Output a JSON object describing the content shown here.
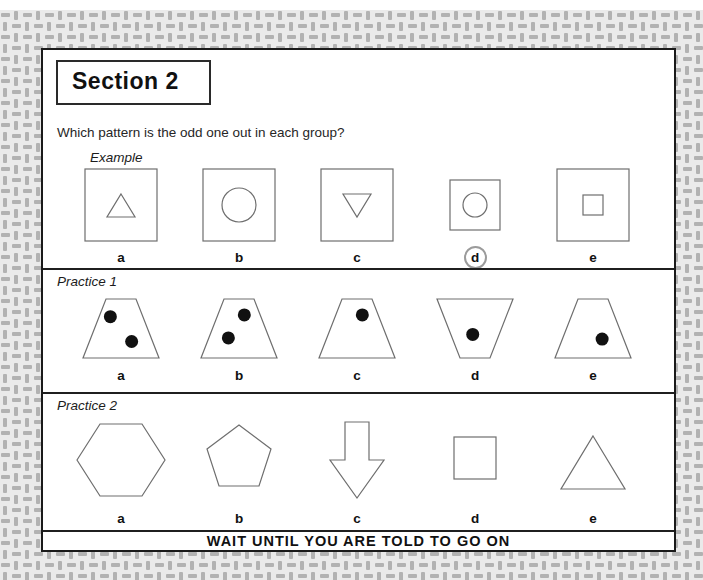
{
  "page": {
    "section_title": "Section 2",
    "question": "Which pattern is the odd one out in each group?",
    "footer": "WAIT UNTIL YOU ARE TOLD TO GO ON"
  },
  "colors": {
    "outline": "#6e6e6e",
    "dot": "#111111",
    "answer_ring": "#9b9b9b",
    "page_border": "#1a1a1a",
    "pattern_base": "#eaeaea",
    "pattern_dash": "#b2b2b2"
  },
  "groups": [
    {
      "label": "Example",
      "items": [
        {
          "label": "a",
          "shape": "square",
          "inner": "triangle-up",
          "selected": false
        },
        {
          "label": "b",
          "shape": "square",
          "inner": "circle",
          "selected": false
        },
        {
          "label": "c",
          "shape": "square",
          "inner": "triangle-down",
          "selected": false
        },
        {
          "label": "d",
          "shape": "square-small",
          "inner": "circle-small",
          "selected": true
        },
        {
          "label": "e",
          "shape": "square",
          "inner": "square-inner",
          "selected": false
        }
      ]
    },
    {
      "label": "Practice 1",
      "items": [
        {
          "label": "a",
          "shape": "trapezoid",
          "dots": [
            [
              0.36,
              0.3
            ],
            [
              0.64,
              0.72
            ]
          ],
          "selected": false
        },
        {
          "label": "b",
          "shape": "trapezoid",
          "dots": [
            [
              0.57,
              0.27
            ],
            [
              0.36,
              0.66
            ]
          ],
          "selected": false
        },
        {
          "label": "c",
          "shape": "trapezoid",
          "dots": [
            [
              0.57,
              0.27
            ]
          ],
          "selected": false
        },
        {
          "label": "d",
          "shape": "trapezoid-inverted",
          "dots": [
            [
              0.47,
              0.6
            ]
          ],
          "selected": false
        },
        {
          "label": "e",
          "shape": "trapezoid",
          "dots": [
            [
              0.62,
              0.68
            ]
          ],
          "selected": false
        }
      ]
    },
    {
      "label": "Practice 2",
      "items": [
        {
          "label": "a",
          "shape": "hexagon",
          "selected": false
        },
        {
          "label": "b",
          "shape": "pentagon",
          "selected": false
        },
        {
          "label": "c",
          "shape": "arrow-down",
          "selected": false
        },
        {
          "label": "d",
          "shape": "square-plain",
          "selected": false
        },
        {
          "label": "e",
          "shape": "triangle",
          "selected": false
        }
      ]
    }
  ]
}
